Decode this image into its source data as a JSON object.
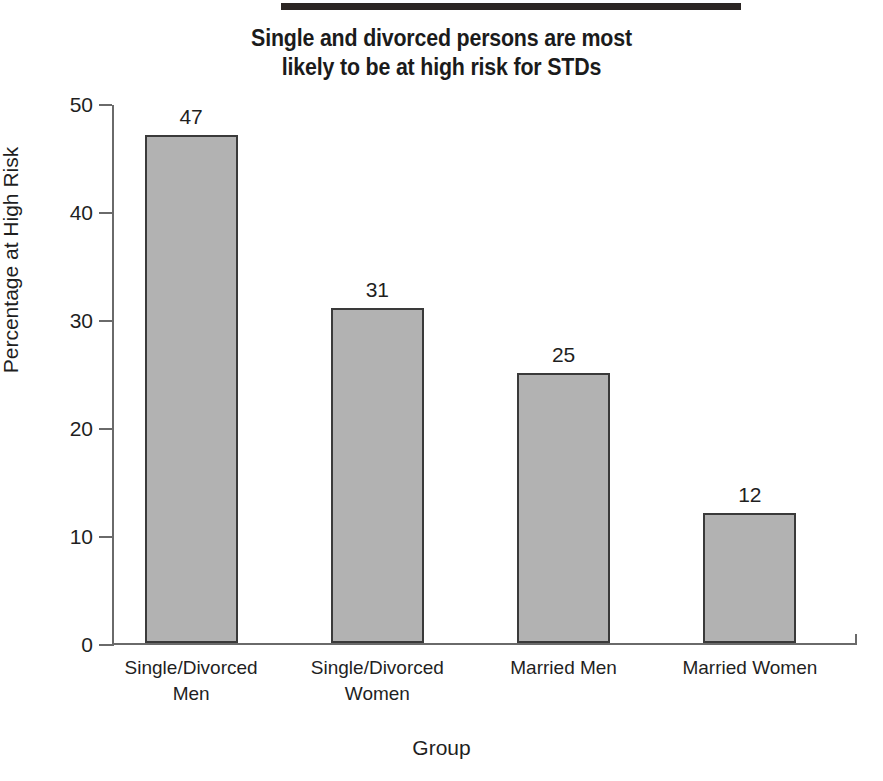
{
  "decor": {
    "top_rule_name": "top-horizontal-rule"
  },
  "title": {
    "line1": "Single and divorced persons are most",
    "line2": "likely to be at high risk for STDs",
    "full": "Single and divorced persons are most likely to be at high risk for STDs"
  },
  "colors": {
    "bar_fill": "#b2b2b2",
    "bar_border": "#3a3a3a",
    "axis": "#6a6a6a",
    "text": "#1f1f1f",
    "rule": "#2b2523",
    "background": "#ffffff"
  },
  "chart_data": {
    "type": "bar",
    "title": "Single and divorced persons are most likely to be at high risk for STDs",
    "xlabel": "Group",
    "ylabel": "Percentage at High Risk",
    "categories": [
      "Single/Divorced Men",
      "Single/Divorced Women",
      "Married Men",
      "Married Women"
    ],
    "category_lines": [
      [
        "Single/Divorced",
        "Men"
      ],
      [
        "Single/Divorced",
        "Women"
      ],
      [
        "Married Men"
      ],
      [
        "Married Women"
      ]
    ],
    "values": [
      47,
      31,
      25,
      12
    ],
    "value_labels": [
      "47",
      "31",
      "25",
      "12"
    ],
    "ylim": [
      0,
      50
    ],
    "yticks": [
      0,
      10,
      20,
      30,
      40,
      50
    ],
    "ytick_labels": [
      "0",
      "10",
      "20",
      "30",
      "40",
      "50"
    ],
    "grid": false,
    "legend": false,
    "bar_labels_position": "above"
  }
}
